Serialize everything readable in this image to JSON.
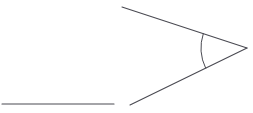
{
  "figure": {
    "background_color": "#ffffff",
    "stroke_color": "#4a4a52",
    "canvas": {
      "width": 253,
      "height": 113
    },
    "elements": {
      "ray_upper": {
        "name": "upper ray",
        "x1": 122,
        "y1": 7,
        "x2": 247,
        "y2": 48,
        "stroke_width": 1.1
      },
      "ray_lower": {
        "name": "lower ray",
        "x1": 247,
        "y1": 48,
        "x2": 130,
        "y2": 105,
        "stroke_width": 1.1
      },
      "segment_horizontal": {
        "name": "horizontal line segment",
        "x1": 2,
        "y1": 104,
        "x2": 114,
        "y2": 104,
        "stroke_width": 1.1
      },
      "angle_arc": {
        "name": "angle arc marker",
        "vertex_x": 247,
        "vertex_y": 48,
        "radius": 46,
        "path": "M 203.3 34.7 A 46 46 0 0 0 205.1 65.4",
        "stroke_width": 1.0
      },
      "vertex_point": {
        "name": "angle vertex",
        "x": 247,
        "y": 48
      }
    }
  }
}
